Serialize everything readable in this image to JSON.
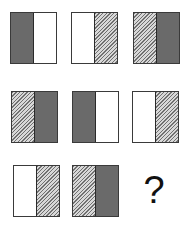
{
  "puzzle": {
    "type": "matrix-pattern",
    "rows": 3,
    "cols": 3,
    "fills_legend": {
      "dark": "solid gray",
      "white": "blank",
      "hatch": "diagonal hatched"
    },
    "colors": {
      "border": "#3a3a3a",
      "dark": "#6a6a6a",
      "white": "#ffffff",
      "hatch_line": "#707070",
      "hatch_bg": "#d8d8d8"
    },
    "cells": [
      {
        "row": 1,
        "col": 1,
        "left": "dark",
        "right": "white"
      },
      {
        "row": 1,
        "col": 2,
        "left": "white",
        "right": "hatch"
      },
      {
        "row": 1,
        "col": 3,
        "left": "hatch",
        "right": "dark"
      },
      {
        "row": 2,
        "col": 1,
        "left": "hatch",
        "right": "dark"
      },
      {
        "row": 2,
        "col": 2,
        "left": "dark",
        "right": "white"
      },
      {
        "row": 2,
        "col": 3,
        "left": "white",
        "right": "hatch"
      },
      {
        "row": 3,
        "col": 1,
        "left": "white",
        "right": "hatch"
      },
      {
        "row": 3,
        "col": 2,
        "left": "hatch",
        "right": "dark"
      }
    ],
    "missing": {
      "row": 3,
      "col": 3,
      "symbol": "?"
    }
  }
}
